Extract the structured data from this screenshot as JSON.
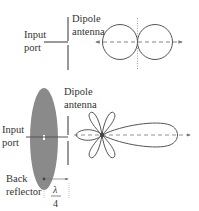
{
  "top_diagram": {
    "input_label_line1": "Input",
    "input_label_line2": "port",
    "antenna_label_line1": "Dipole",
    "antenna_label_line2": "antenna",
    "pattern_type": "figure-eight (bidirectional)"
  },
  "bottom_diagram": {
    "input_label_line1": "Input",
    "input_label_line2": "port",
    "antenna_label_line1": "Dipole",
    "antenna_label_line2": "antenna",
    "reflector_label_line1": "Back",
    "reflector_label_line2": "reflector",
    "spacing_numerator": "λ",
    "spacing_denominator": "4",
    "pattern_type": "directional with main lobe and side lobes"
  },
  "colors": {
    "line": "#555555",
    "reflector_fill": "#8a8a8a",
    "text": "#333333",
    "dashed_axis": "#777777"
  }
}
